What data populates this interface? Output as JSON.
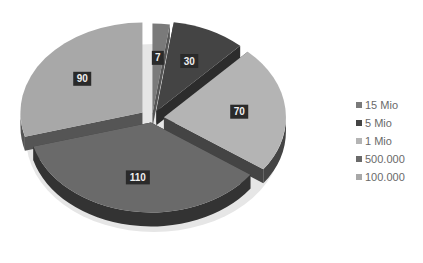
{
  "chart_data": {
    "type": "pie",
    "style": "3d-exploded",
    "title": "",
    "categories": [
      "15 Mio",
      "5 Mio",
      "1 Mio",
      "500.000",
      "100.000"
    ],
    "values": [
      7,
      30,
      70,
      110,
      90
    ],
    "colors": [
      "#7a7a7a",
      "#444444",
      "#b4b4b4",
      "#6a6a6a",
      "#a8a8a8"
    ],
    "side_colors": [
      "#555555",
      "#2c2c2c",
      "#444444",
      "#333333",
      "#555555"
    ],
    "data_labels": [
      "7",
      "30",
      "70",
      "110",
      "90"
    ],
    "legend_position": "right"
  },
  "legend": {
    "items": [
      {
        "label": "15 Mio",
        "color": "#7a7a7a"
      },
      {
        "label": "5 Mio",
        "color": "#444444"
      },
      {
        "label": "1 Mio",
        "color": "#b4b4b4"
      },
      {
        "label": "500.000",
        "color": "#6a6a6a"
      },
      {
        "label": "100.000",
        "color": "#a8a8a8"
      }
    ]
  }
}
